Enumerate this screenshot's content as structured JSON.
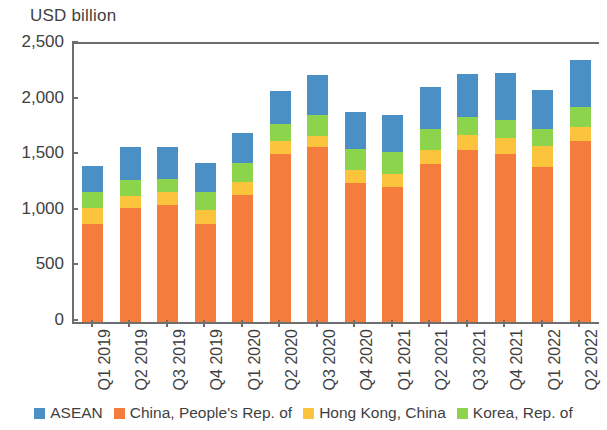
{
  "chart_data": {
    "type": "bar",
    "stacked": true,
    "title": "",
    "subtitle": "",
    "xlabel": "",
    "ylabel": "USD billion",
    "ylim": [
      0,
      2500
    ],
    "yticks": [
      "0",
      "500",
      "1,000",
      "1,500",
      "2,000",
      "2,500"
    ],
    "ytick_values": [
      0,
      500,
      1000,
      1500,
      2000,
      2500
    ],
    "grid": false,
    "legend_position": "bottom",
    "categories": [
      "Q1 2019",
      "Q2 2019",
      "Q3 2019",
      "Q4 2019",
      "Q1 2020",
      "Q2 2020",
      "Q3 2020",
      "Q4 2020",
      "Q1 2021",
      "Q2 2021",
      "Q3 2021",
      "Q4 2021",
      "Q1 2022",
      "Q2 2022"
    ],
    "series": [
      {
        "name": "China, People's Rep. of",
        "color": "#F47C3C",
        "values": [
          880,
          1025,
          1050,
          880,
          1140,
          1510,
          1570,
          1250,
          1215,
          1420,
          1545,
          1510,
          1395,
          1625
        ]
      },
      {
        "name": "Hong Kong, China",
        "color": "#FCC43C",
        "values": [
          145,
          110,
          115,
          125,
          120,
          115,
          100,
          115,
          115,
          125,
          135,
          145,
          190,
          125
        ]
      },
      {
        "name": "Korea, Rep. of",
        "color": "#8CD44C",
        "values": [
          145,
          145,
          120,
          160,
          170,
          155,
          190,
          190,
          200,
          190,
          160,
          160,
          155,
          180
        ]
      },
      {
        "name": "ASEAN",
        "color": "#4A90C4",
        "values": [
          235,
          290,
          290,
          265,
          270,
          300,
          360,
          335,
          330,
          375,
          395,
          425,
          350,
          430
        ]
      }
    ],
    "totals": [
      1405,
      1570,
      1575,
      1430,
      1700,
      2080,
      2220,
      1890,
      1860,
      2110,
      2235,
      2240,
      2090,
      2360
    ]
  },
  "legend": {
    "items": [
      {
        "label": "ASEAN",
        "color": "#4A90C4"
      },
      {
        "label": "China, People's Rep. of",
        "color": "#F47C3C"
      },
      {
        "label": "Hong Kong, China",
        "color": "#FCC43C"
      },
      {
        "label": "Korea, Rep. of",
        "color": "#8CD44C"
      }
    ]
  }
}
